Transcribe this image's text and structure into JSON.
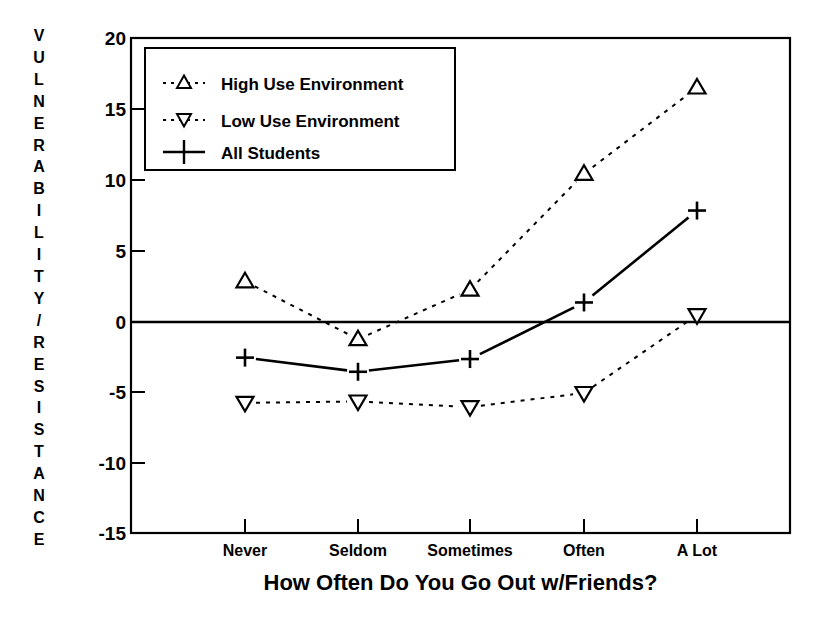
{
  "chart_data": {
    "type": "line",
    "title": "",
    "xlabel": "How Often Do You Go Out w/Friends?",
    "ylabel": "VULNERABILITY/RESISTANCE",
    "categories": [
      "Never",
      "Seldom",
      "Sometimes",
      "Often",
      "A Lot"
    ],
    "ylim": [
      -15,
      20
    ],
    "yticks": [
      20,
      15,
      10,
      5,
      0,
      -5,
      -10,
      -15
    ],
    "ytick_labels": [
      "20",
      "15",
      "10",
      "5",
      "0",
      "-5",
      "-10",
      "-15"
    ],
    "grid": false,
    "zero_line": true,
    "legend_position": "upper-left-inside",
    "series": [
      {
        "name": "High Use Environment",
        "marker": "triangle-up",
        "linestyle": "dashed",
        "values": [
          2.8,
          -1.3,
          2.2,
          10.4,
          16.5
        ]
      },
      {
        "name": "Low Use Environment",
        "marker": "triangle-down",
        "linestyle": "dashed",
        "values": [
          -5.8,
          -5.7,
          -6.1,
          -5.1,
          0.4
        ]
      },
      {
        "name": "All Students",
        "marker": "plus",
        "linestyle": "solid",
        "values": [
          -2.6,
          -3.6,
          -2.7,
          1.3,
          7.8
        ]
      }
    ]
  },
  "axis": {
    "ylabel_letters": [
      "V",
      "U",
      "L",
      "N",
      "E",
      "R",
      "A",
      "B",
      "I",
      "L",
      "I",
      "T",
      "Y",
      "/",
      "R",
      "E",
      "S",
      "I",
      "S",
      "T",
      "A",
      "N",
      "C",
      "E"
    ],
    "xlabel": "How Often Do You Go Out w/Friends?",
    "ytick_labels": [
      "20",
      "15",
      "10",
      "5",
      "0",
      "-5",
      "-10",
      "-15"
    ],
    "xtick_labels": [
      "Never",
      "Seldom",
      "Sometimes",
      "Often",
      "A Lot"
    ]
  },
  "legend": {
    "entries": [
      {
        "label": "High Use Environment",
        "marker": "triangle-up-icon"
      },
      {
        "label": "Low Use Environment",
        "marker": "triangle-down-icon"
      },
      {
        "label": "All Students",
        "marker": "plus-icon"
      }
    ]
  },
  "colors": {
    "ink": "#000000",
    "background": "#ffffff"
  }
}
